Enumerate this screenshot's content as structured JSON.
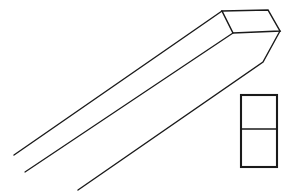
{
  "figure": {
    "background_color": "#ffffff",
    "ink_color": "#1a1a1a",
    "canvas": {
      "width": 288,
      "height": 193
    },
    "style": "vintage engraved line art, black ink on white"
  },
  "geometry": {
    "end_face": {
      "name": "end-face-parallelogram",
      "points": "222,11 268,10 280,31 233,33",
      "description": "angled flat end face of the bar, four-sided"
    },
    "top_ridge": {
      "name": "top-ridge-edge",
      "from": "222,11",
      "to": "14,155",
      "path": "M222,11 L14,155"
    },
    "middle_ridge": {
      "name": "middle-ridge-edge",
      "from": "233,33",
      "to": "25,172",
      "path": "M233,33 L25,172"
    },
    "lower_edge": {
      "name": "lower-edge-with-bevel",
      "path": "M280,31 L263,62 L78,190",
      "bend_vertex": "263,62"
    },
    "cross_section": {
      "name": "cross-section-rectangle",
      "x": 241,
      "y": 95,
      "width": 36,
      "height": 72,
      "divider_y": 129,
      "description": "two-part rectangle: upper cell and lower cell"
    }
  },
  "labels": {
    "none_visible": ""
  }
}
